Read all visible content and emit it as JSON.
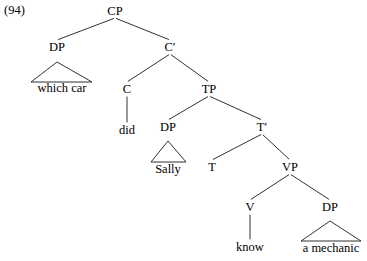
{
  "figure": {
    "example_number": "(94)",
    "caption": ""
  },
  "tree": {
    "nodes": [
      {
        "id": "cp",
        "label": "CP",
        "x": 115,
        "y": 11
      },
      {
        "id": "dp1",
        "label": "DP",
        "x": 57,
        "y": 47
      },
      {
        "id": "cbar",
        "label": "C′",
        "x": 170,
        "y": 47
      },
      {
        "id": "c",
        "label": "C",
        "x": 127,
        "y": 89
      },
      {
        "id": "tp",
        "label": "TP",
        "x": 209,
        "y": 89
      },
      {
        "id": "dp2",
        "label": "DP",
        "x": 168,
        "y": 127
      },
      {
        "id": "tbar",
        "label": "T′",
        "x": 262,
        "y": 127
      },
      {
        "id": "t",
        "label": "T",
        "x": 212,
        "y": 167
      },
      {
        "id": "vp",
        "label": "VP",
        "x": 290,
        "y": 167
      },
      {
        "id": "v",
        "label": "V",
        "x": 250,
        "y": 207
      },
      {
        "id": "dp3",
        "label": "DP",
        "x": 330,
        "y": 207
      }
    ],
    "leaves": [
      {
        "id": "which-car",
        "label": "which car",
        "x": 62,
        "y": 88
      },
      {
        "id": "did",
        "label": "did",
        "x": 127,
        "y": 130
      },
      {
        "id": "sally",
        "label": "Sally",
        "x": 168,
        "y": 169
      },
      {
        "id": "know",
        "label": "know",
        "x": 250,
        "y": 247
      },
      {
        "id": "a-mechanic",
        "label": "a mechanic",
        "x": 331,
        "y": 248
      }
    ],
    "branches": [
      {
        "from": "cp",
        "to": "dp1"
      },
      {
        "from": "cp",
        "to": "cbar"
      },
      {
        "from": "cbar",
        "to": "c"
      },
      {
        "from": "cbar",
        "to": "tp"
      },
      {
        "from": "tp",
        "to": "dp2"
      },
      {
        "from": "tp",
        "to": "tbar"
      },
      {
        "from": "tbar",
        "to": "t"
      },
      {
        "from": "tbar",
        "to": "vp"
      },
      {
        "from": "vp",
        "to": "v"
      },
      {
        "from": "vp",
        "to": "dp3"
      }
    ],
    "stems": [
      {
        "node": "c",
        "leaf": "did"
      },
      {
        "node": "v",
        "leaf": "know"
      }
    ],
    "triangles": [
      {
        "id": "tri-which-car",
        "apex_x": 57,
        "apex_y": 62,
        "left_x": 31,
        "right_x": 92,
        "base_y": 82
      },
      {
        "id": "tri-sally",
        "apex_x": 168,
        "apex_y": 141,
        "left_x": 151,
        "right_x": 186,
        "base_y": 162
      },
      {
        "id": "tri-a-mechanic",
        "apex_x": 330,
        "apex_y": 221,
        "left_x": 301,
        "right_x": 361,
        "base_y": 241
      }
    ],
    "style": {
      "line_color": "#1a1a1a",
      "line_width": 0.9,
      "text_color": "#000000",
      "background": "#ffffff"
    }
  }
}
